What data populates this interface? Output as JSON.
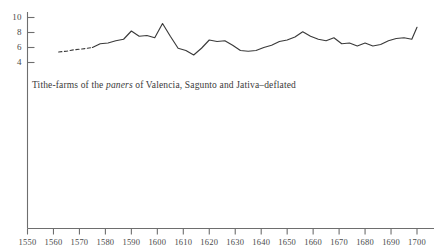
{
  "chart_data": {
    "type": "line",
    "title": "",
    "caption_prefix": "Tithe-farms of the ",
    "caption_italic": "paners",
    "caption_suffix": " of Valencia, Sagunto and Jativa–deflated",
    "xlabel": "",
    "ylabel": "",
    "xlim": [
      1550,
      1700
    ],
    "ylim": [
      0,
      11
    ],
    "grid": false,
    "legend": null,
    "yticks": [
      10,
      8,
      6,
      4
    ],
    "ytick_labels": [
      "10",
      "8",
      "6",
      "4"
    ],
    "xticks": [
      1550,
      1560,
      1570,
      1580,
      1590,
      1600,
      1610,
      1620,
      1630,
      1640,
      1650,
      1660,
      1670,
      1680,
      1690,
      1700
    ],
    "xtick_labels": [
      "1550",
      "1560",
      "1570",
      "1580",
      "1590",
      "1600",
      "1610",
      "1620",
      "1630",
      "1640",
      "1650",
      "1660",
      "1670",
      "1680",
      "1690",
      "1700"
    ],
    "line_color": "#3a3a3a",
    "axis_color": "#6e6e6e",
    "series": [
      {
        "name": "Tithe-farms deflated",
        "style": "dashed",
        "note": "interpolated opening segment",
        "x": [
          1562,
          1565,
          1568,
          1571,
          1575
        ],
        "values": [
          5.4,
          5.5,
          5.7,
          5.8,
          6.0
        ]
      },
      {
        "name": "Tithe-farms deflated",
        "style": "solid",
        "x": [
          1575,
          1578,
          1581,
          1584,
          1587,
          1590,
          1593,
          1596,
          1599,
          1602,
          1605,
          1608,
          1611,
          1614,
          1617,
          1620,
          1623,
          1626,
          1629,
          1632,
          1635,
          1638,
          1641,
          1644,
          1647,
          1650,
          1653,
          1656,
          1659,
          1662,
          1665,
          1668,
          1671,
          1674,
          1677,
          1680,
          1683,
          1686,
          1689,
          1692,
          1695,
          1698,
          1700
        ],
        "values": [
          6.0,
          6.5,
          6.6,
          6.9,
          7.1,
          8.2,
          7.5,
          7.6,
          7.3,
          9.2,
          7.5,
          5.9,
          5.6,
          5.0,
          5.9,
          7.0,
          6.8,
          6.9,
          6.3,
          5.6,
          5.5,
          5.6,
          6.0,
          6.3,
          6.8,
          7.0,
          7.4,
          8.1,
          7.5,
          7.1,
          6.9,
          7.3,
          6.5,
          6.6,
          6.2,
          6.6,
          6.2,
          6.4,
          6.9,
          7.2,
          7.3,
          7.1,
          8.7
        ]
      }
    ]
  }
}
